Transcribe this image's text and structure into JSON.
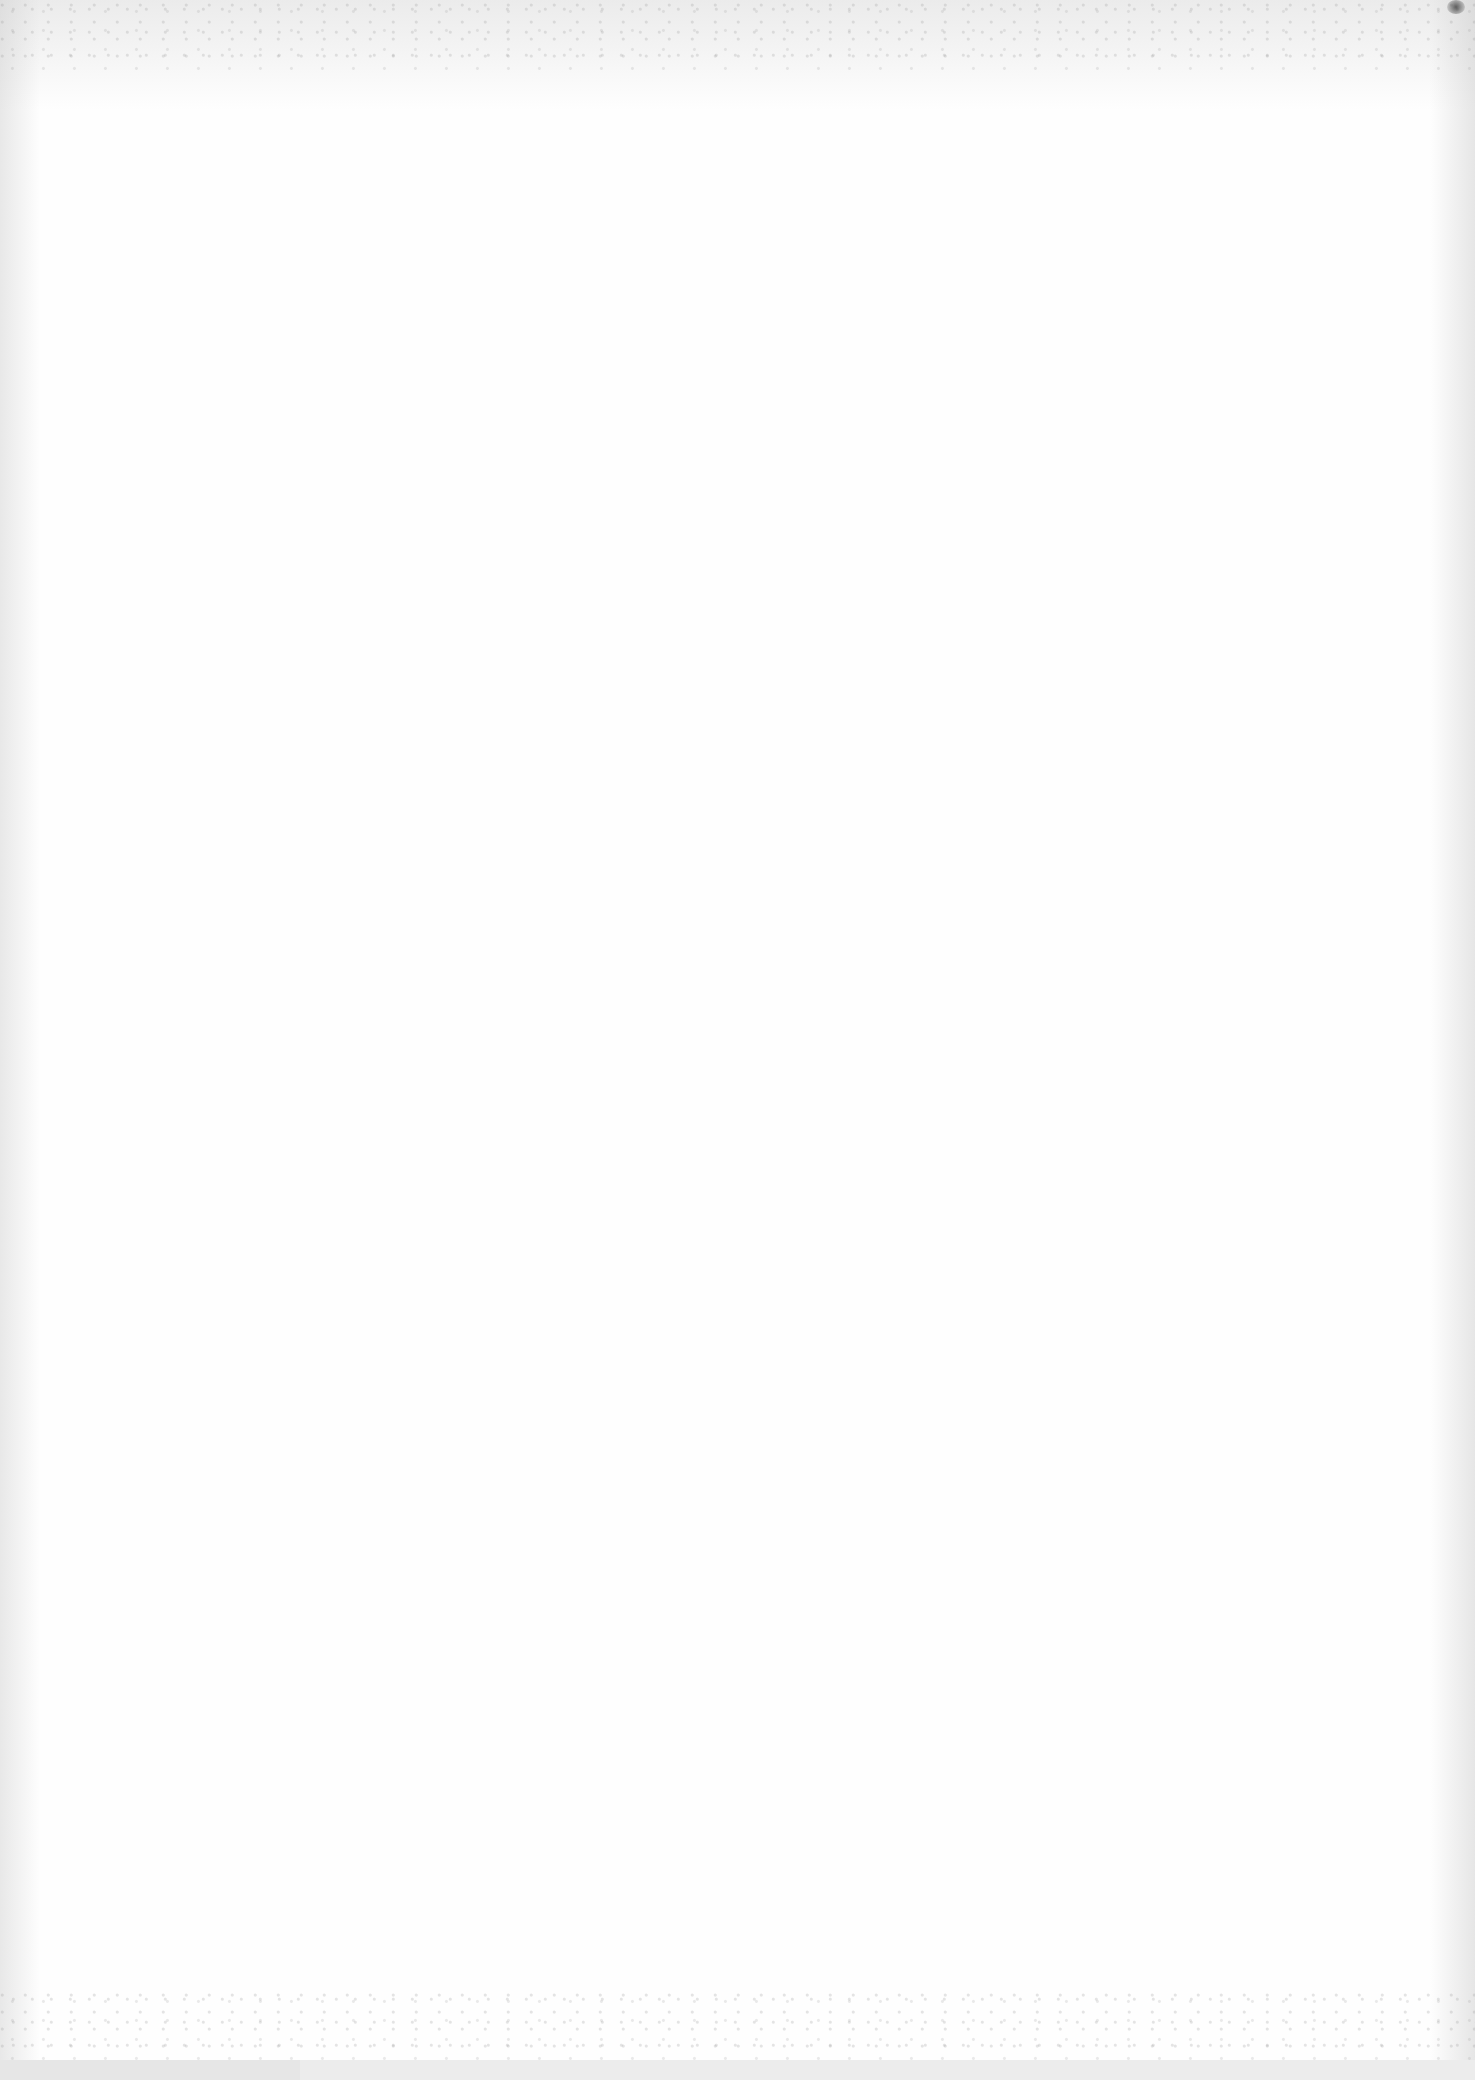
{
  "document": {
    "type": "scanned-page",
    "content": "",
    "text_blocks": []
  },
  "colors": {
    "paper": "#fefefe",
    "bottom_band": "#ececec"
  }
}
